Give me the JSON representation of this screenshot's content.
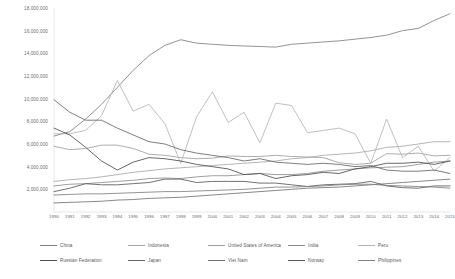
{
  "chart_data": {
    "type": "line",
    "title": "",
    "subtitle": "",
    "xlabel": "",
    "ylabel": "",
    "grid": false,
    "legend_position": "bottom",
    "xlim": [
      1990,
      2015
    ],
    "ylim": [
      0,
      18000000
    ],
    "y_ticks": [
      "18,000,000",
      "16,000,000",
      "14,000,000",
      "12,000,000",
      "10,000,000",
      "8,000,000",
      "6,000,000",
      "4,000,000",
      "2,000,000"
    ],
    "y_tick_values": [
      18000000,
      16000000,
      14000000,
      12000000,
      10000000,
      8000000,
      6000000,
      4000000,
      2000000
    ],
    "categories": [
      "1990",
      "1991",
      "1992",
      "1993",
      "1994",
      "1995",
      "1996",
      "1997",
      "1998",
      "1999",
      "2000",
      "2001",
      "2002",
      "2003",
      "2004",
      "2005",
      "2006",
      "2007",
      "2008",
      "2009",
      "2010",
      "2011",
      "2012",
      "2013",
      "2014",
      "2015"
    ],
    "series": [
      {
        "name": "China",
        "color": "#7f7f7f",
        "values": [
          6700000,
          7100000,
          8200000,
          9500000,
          11000000,
          12500000,
          13800000,
          14700000,
          15200000,
          14900000,
          14800000,
          14700000,
          14650000,
          14600000,
          14550000,
          14800000,
          14900000,
          15000000,
          15100000,
          15250000,
          15400000,
          15600000,
          16000000,
          16200000,
          16900000,
          17500000
        ]
      },
      {
        "name": "Indonesia",
        "color": "#a6a6a6",
        "values": [
          2700000,
          2850000,
          2950000,
          3100000,
          3300000,
          3500000,
          3650000,
          3800000,
          3900000,
          4000000,
          4100000,
          4200000,
          4300000,
          4400000,
          4500000,
          4700000,
          4800000,
          5000000,
          5100000,
          5200000,
          5400000,
          5700000,
          5800000,
          6000000,
          6200000,
          6200000
        ]
      },
      {
        "name": "United States of America",
        "color": "#9e9e9e",
        "values": [
          5800000,
          5500000,
          5600000,
          5900000,
          5900000,
          5600000,
          5100000,
          5000000,
          4800000,
          4700000,
          4750000,
          4950000,
          4900000,
          4900000,
          5000000,
          4900000,
          4850000,
          4800000,
          4350000,
          4200000,
          4300000,
          5150000,
          5100000,
          5200000,
          4950000,
          5000000
        ]
      },
      {
        "name": "India",
        "color": "#8c8c8c",
        "values": [
          2300000,
          2450000,
          2500000,
          2600000,
          2700000,
          2800000,
          2950000,
          3000000,
          2950000,
          3100000,
          3200000,
          3200000,
          3300000,
          3400000,
          3300000,
          3300000,
          3400000,
          3600000,
          3700000,
          3800000,
          3900000,
          3950000,
          4000000,
          4200000,
          4400000,
          4500000
        ]
      },
      {
        "name": "Peru",
        "color": "#b3b3b3",
        "values": [
          6900000,
          6900000,
          7200000,
          8500000,
          11600000,
          8900000,
          9500000,
          7800000,
          4300000,
          8400000,
          10600000,
          7900000,
          8800000,
          6100000,
          9600000,
          9400000,
          7000000,
          7200000,
          7400000,
          6900000,
          4300000,
          8200000,
          4800000,
          5800000,
          3600000,
          4800000
        ]
      },
      {
        "name": "Russian Federation",
        "color": "#4d4d4d",
        "values": [
          7400000,
          6800000,
          5700000,
          4500000,
          3700000,
          4400000,
          4800000,
          4700000,
          4500000,
          4200000,
          4000000,
          3800000,
          3300000,
          3400000,
          2950000,
          3200000,
          3300000,
          3500000,
          3400000,
          3800000,
          4000000,
          4300000,
          4300000,
          4400000,
          4200000,
          4500000
        ]
      },
      {
        "name": "Japan",
        "color": "#666666",
        "values": [
          9900000,
          8800000,
          8100000,
          8100000,
          7400000,
          6800000,
          6200000,
          6000000,
          5500000,
          5200000,
          5000000,
          4800000,
          4500000,
          4700000,
          4400000,
          4300000,
          4200000,
          4300000,
          4200000,
          4000000,
          4100000,
          3700000,
          3600000,
          3600000,
          3700000,
          3400000
        ]
      },
      {
        "name": "Viet Nam",
        "color": "#737373",
        "values": [
          800000,
          850000,
          900000,
          950000,
          1050000,
          1100000,
          1200000,
          1250000,
          1300000,
          1400000,
          1500000,
          1600000,
          1700000,
          1800000,
          1900000,
          2000000,
          2100000,
          2150000,
          2200000,
          2300000,
          2400000,
          2500000,
          2600000,
          2700000,
          2800000,
          2900000
        ]
      },
      {
        "name": "Norway",
        "color": "#595959",
        "values": [
          1800000,
          2100000,
          2500000,
          2400000,
          2400000,
          2500000,
          2600000,
          2900000,
          2900000,
          2600000,
          2700000,
          2700000,
          2700000,
          2550000,
          2550000,
          2400000,
          2250000,
          2400000,
          2450000,
          2500000,
          2700000,
          2300000,
          2150000,
          2100000,
          2300000,
          2300000
        ]
      },
      {
        "name": "Philippines",
        "color": "#808080",
        "values": [
          1500000,
          1550000,
          1600000,
          1600000,
          1650000,
          1700000,
          1750000,
          1800000,
          1800000,
          1850000,
          1900000,
          1950000,
          2000000,
          2100000,
          2200000,
          2200000,
          2250000,
          2300000,
          2400000,
          2450000,
          2450000,
          2350000,
          2300000,
          2250000,
          2200000,
          2100000
        ]
      }
    ]
  },
  "legend": {
    "rows": [
      [
        {
          "label": "China",
          "color": "#7f7f7f",
          "x": 40
        },
        {
          "label": "Indonesia",
          "color": "#a6a6a6",
          "x": 128
        },
        {
          "label": "United States of America",
          "color": "#9e9e9e",
          "x": 208
        },
        {
          "label": "India",
          "color": "#8c8c8c",
          "x": 288
        },
        {
          "label": "Peru",
          "color": "#b3b3b3",
          "x": 358
        }
      ],
      [
        {
          "label": "Russian Federation",
          "color": "#4d4d4d",
          "x": 40
        },
        {
          "label": "Japan",
          "color": "#666666",
          "x": 128
        },
        {
          "label": "Viet Nam",
          "color": "#737373",
          "x": 208
        },
        {
          "label": "Norway",
          "color": "#595959",
          "x": 288
        },
        {
          "label": "Philippines",
          "color": "#808080",
          "x": 358
        }
      ]
    ]
  }
}
